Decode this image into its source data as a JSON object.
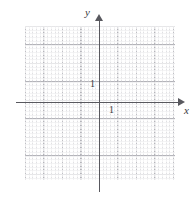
{
  "figure": {
    "kind": "cartesian-coordinate-grid",
    "background_color": "#ffffff",
    "axis_color": "#58585e",
    "grid_major_color": "#b0b0b6",
    "grid_minor_color": "#c8c8cd"
  },
  "axes": {
    "x": {
      "label": "x",
      "unit_tick_label": "1",
      "arrow": "right"
    },
    "y": {
      "label": "y",
      "unit_tick_label": "1",
      "arrow": "up"
    }
  },
  "chart_data": {
    "type": "scatter",
    "title": "",
    "xlabel": "x",
    "ylabel": "y",
    "xlim": [
      -4,
      4
    ],
    "ylim": [
      -4,
      4.5
    ],
    "xticks": [
      "1"
    ],
    "yticks": [
      "1"
    ],
    "grid": true,
    "series": [],
    "values": [],
    "annotations": []
  }
}
